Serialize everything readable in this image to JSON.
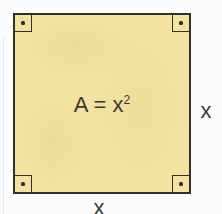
{
  "figure": {
    "area_formula": {
      "base": "A = x",
      "exponent": "2"
    },
    "right_side_label": "x",
    "bottom_side_label": "x",
    "corner_marker_count": 4,
    "colors": {
      "background": "#FCFCFC",
      "square_fill": "#F3E2A0",
      "square_border": "#31312A",
      "text": "#3A3A33",
      "marker_dot": "#2E2E28"
    }
  }
}
